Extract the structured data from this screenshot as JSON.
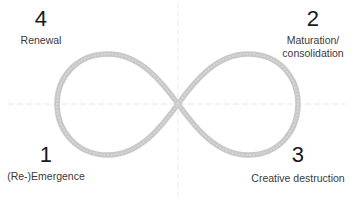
{
  "diagram": {
    "type": "infinity-loop-cycle",
    "colors": {
      "curve": "#c8c8c8",
      "curve_highlight": "#dcdcdc",
      "axis": "#e6e6e6",
      "text": "#222222"
    },
    "phases": [
      {
        "number": "1",
        "label": "(Re-)Emergence",
        "position": "bottom-left"
      },
      {
        "number": "2",
        "label_line1": "Maturation/",
        "label_line2": "consolidation",
        "position": "top-right"
      },
      {
        "number": "3",
        "label": "Creative destruction",
        "position": "bottom-right"
      },
      {
        "number": "4",
        "label": "Renewal",
        "position": "top-left"
      }
    ]
  }
}
